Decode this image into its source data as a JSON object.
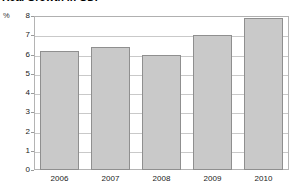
{
  "chart_data": {
    "type": "bar",
    "title": "Real Growth in GDP",
    "xlabel": "",
    "ylabel": "%",
    "categories": [
      "2006",
      "2007",
      "2008",
      "2009",
      "2010"
    ],
    "values": [
      6.2,
      6.4,
      6.0,
      7.0,
      7.9
    ],
    "ylim": [
      0,
      8
    ],
    "yticks": [
      0,
      1,
      2,
      3,
      4,
      5,
      6,
      7,
      8
    ],
    "ytick_labels": [
      "0",
      "1",
      "2",
      "3",
      "4",
      "5",
      "6",
      "7",
      "8"
    ],
    "grid": true,
    "grid_axis": "y",
    "legend": false,
    "bar_color": "#c9c9c9",
    "bar_edge_color": "#8f8f8f",
    "grid_color": "#c9c9c9",
    "axis_color": "#b4b4b4",
    "background_color": "#ffffff"
  },
  "axis": {
    "unit_label": "%"
  }
}
